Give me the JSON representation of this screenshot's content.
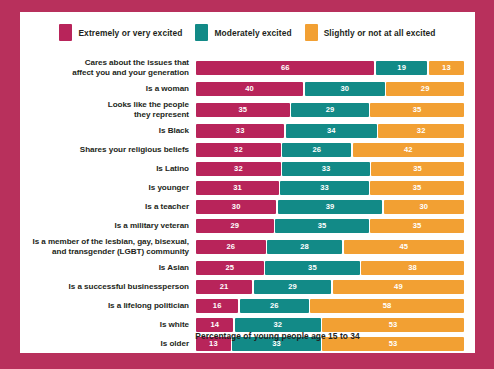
{
  "colors": {
    "frame": "#b8305c",
    "panel": "#ffffff",
    "series_0": "#b8245a",
    "series_1": "#128a87",
    "series_2": "#f2a033",
    "text": "#231f20",
    "tick": "#8fc7c4"
  },
  "legend": {
    "position": "top-center",
    "items": [
      {
        "label": "Extremely or very excited",
        "color": "#b8245a",
        "swatch_name": "legend-swatch-extremely-very-excited"
      },
      {
        "label": "Moderately excited",
        "color": "#128a87",
        "swatch_name": "legend-swatch-moderately-excited"
      },
      {
        "label": "Slightly or not at all excited",
        "color": "#f2a033",
        "swatch_name": "legend-swatch-slightly-not-at-all-excited"
      }
    ]
  },
  "footnote": "Percentage of young people age 15 to 34",
  "chart_data": {
    "type": "bar",
    "subtype": "stacked-horizontal-100",
    "title": "",
    "subtitle": "",
    "xlabel": "Percentage of young people age 15 to 34",
    "ylabel": "",
    "xlim": [
      0,
      100
    ],
    "grid": false,
    "legend_position": "top-center",
    "categories": [
      "Cares about the issues that affect you and your generation",
      "Is a woman",
      "Looks like the people they represent",
      "Is Black",
      "Shares your religious beliefs",
      "Is Latino",
      "Is younger",
      "Is a teacher",
      "Is a military veteran",
      "Is a member of the lesbian, gay, bisexual, and transgender (LGBT) community",
      "Is Asian",
      "Is a successful businessperson",
      "Is a lifelong politician",
      "Is white",
      "Is older",
      "Is a celebrity"
    ],
    "series": [
      {
        "name": "Extremely or very excited",
        "color": "#b8245a",
        "values": [
          66,
          40,
          35,
          33,
          32,
          32,
          31,
          30,
          29,
          26,
          25,
          21,
          16,
          14,
          13,
          9
        ]
      },
      {
        "name": "Moderately excited",
        "color": "#128a87",
        "values": [
          19,
          30,
          29,
          34,
          26,
          33,
          33,
          39,
          35,
          28,
          35,
          29,
          26,
          32,
          33,
          17
        ]
      },
      {
        "name": "Slightly or not at all excited",
        "color": "#f2a033",
        "values": [
          13,
          29,
          35,
          32,
          42,
          35,
          35,
          30,
          35,
          45,
          38,
          49,
          58,
          53,
          53,
          73
        ]
      }
    ]
  },
  "rows": [
    {
      "label_lines": [
        "Cares about the issues that",
        "affect you and your generation"
      ],
      "values": [
        66,
        19,
        13
      ]
    },
    {
      "label_lines": [
        "Is a woman"
      ],
      "values": [
        40,
        30,
        29
      ]
    },
    {
      "label_lines": [
        "Looks like the people",
        "they represent"
      ],
      "values": [
        35,
        29,
        35
      ]
    },
    {
      "label_lines": [
        "Is Black"
      ],
      "values": [
        33,
        34,
        32
      ]
    },
    {
      "label_lines": [
        "Shares your religious beliefs"
      ],
      "values": [
        32,
        26,
        42
      ]
    },
    {
      "label_lines": [
        "Is Latino"
      ],
      "values": [
        32,
        33,
        35
      ]
    },
    {
      "label_lines": [
        "Is younger"
      ],
      "values": [
        31,
        33,
        35
      ]
    },
    {
      "label_lines": [
        "Is a teacher"
      ],
      "values": [
        30,
        39,
        30
      ]
    },
    {
      "label_lines": [
        "Is a military veteran"
      ],
      "values": [
        29,
        35,
        35
      ]
    },
    {
      "label_lines": [
        "Is a member of the lesbian, gay, bisexual,",
        "and transgender (LGBT) community"
      ],
      "values": [
        26,
        28,
        45
      ]
    },
    {
      "label_lines": [
        "Is Asian"
      ],
      "values": [
        25,
        35,
        38
      ]
    },
    {
      "label_lines": [
        "Is a successful businessperson"
      ],
      "values": [
        21,
        29,
        49
      ]
    },
    {
      "label_lines": [
        "Is a lifelong politician"
      ],
      "values": [
        16,
        26,
        58
      ]
    },
    {
      "label_lines": [
        "Is white"
      ],
      "values": [
        14,
        32,
        53
      ]
    },
    {
      "label_lines": [
        "Is older"
      ],
      "values": [
        13,
        33,
        53
      ]
    },
    {
      "label_lines": [
        "Is a celebrity"
      ],
      "values": [
        9,
        17,
        73
      ]
    }
  ]
}
